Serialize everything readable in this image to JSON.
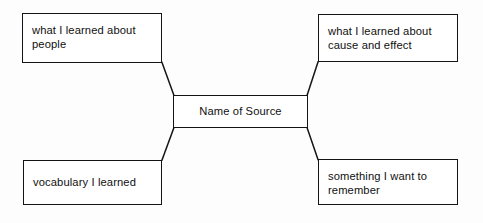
{
  "diagram": {
    "type": "concept-map",
    "center": {
      "id": "center",
      "label": "Name of Source"
    },
    "branches": [
      {
        "id": "top-left",
        "label": "what I learned about people",
        "position": "top-left"
      },
      {
        "id": "top-right",
        "label": "what I learned about cause and effect",
        "position": "top-right"
      },
      {
        "id": "bottom-left",
        "label": "vocabulary I learned",
        "position": "bottom-left"
      },
      {
        "id": "bottom-right",
        "label": "something I want to remember",
        "position": "bottom-right"
      }
    ],
    "connectors": [
      {
        "id": "connector-top-left",
        "from": "top-left",
        "to": "center"
      },
      {
        "id": "connector-top-right",
        "from": "top-right",
        "to": "center"
      },
      {
        "id": "connector-bottom-left",
        "from": "bottom-left",
        "to": "center"
      },
      {
        "id": "connector-bottom-right",
        "from": "bottom-right",
        "to": "center"
      }
    ],
    "colors": {
      "stroke": "#141414",
      "text": "#101010",
      "background": "#fdfdfd",
      "node_fill": "#ffffff"
    }
  }
}
